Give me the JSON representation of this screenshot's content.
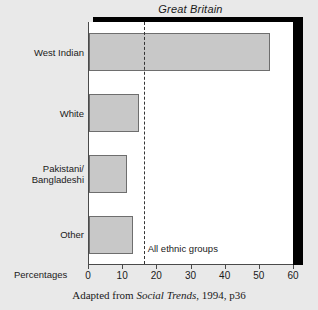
{
  "chart_data": {
    "type": "bar",
    "orientation": "horizontal",
    "title": "Great Britain",
    "categories": [
      "West Indian",
      "White",
      "Pakistani/\nBangladeshi",
      "Other"
    ],
    "values": [
      53,
      14.6,
      11,
      12.9
    ],
    "xlabel": "Percentages",
    "ylabel": "",
    "xlim": [
      0,
      60
    ],
    "xticks": [
      0,
      10,
      20,
      30,
      40,
      50,
      60
    ],
    "xtick_labels": [
      "0",
      "10",
      "20",
      "30",
      "40",
      "50",
      "60"
    ],
    "grid": false,
    "legend": null,
    "annotations": [
      {
        "name": "all-ethnic-groups-reference",
        "label": "All ethnic groups",
        "value": 16,
        "style": "dashed-vertical-line"
      }
    ],
    "series": [
      {
        "name": "Percentage",
        "values": [
          53,
          14.6,
          11,
          12.9
        ]
      }
    ],
    "bar_color": "#c8c8c8",
    "bar_edge_color": "#6e6e6e"
  },
  "caption": {
    "prefix": "Adapted from ",
    "work": "Social Trends",
    "suffix": ", 1994, p36"
  },
  "axis": {
    "unit_label": "Percentages"
  }
}
